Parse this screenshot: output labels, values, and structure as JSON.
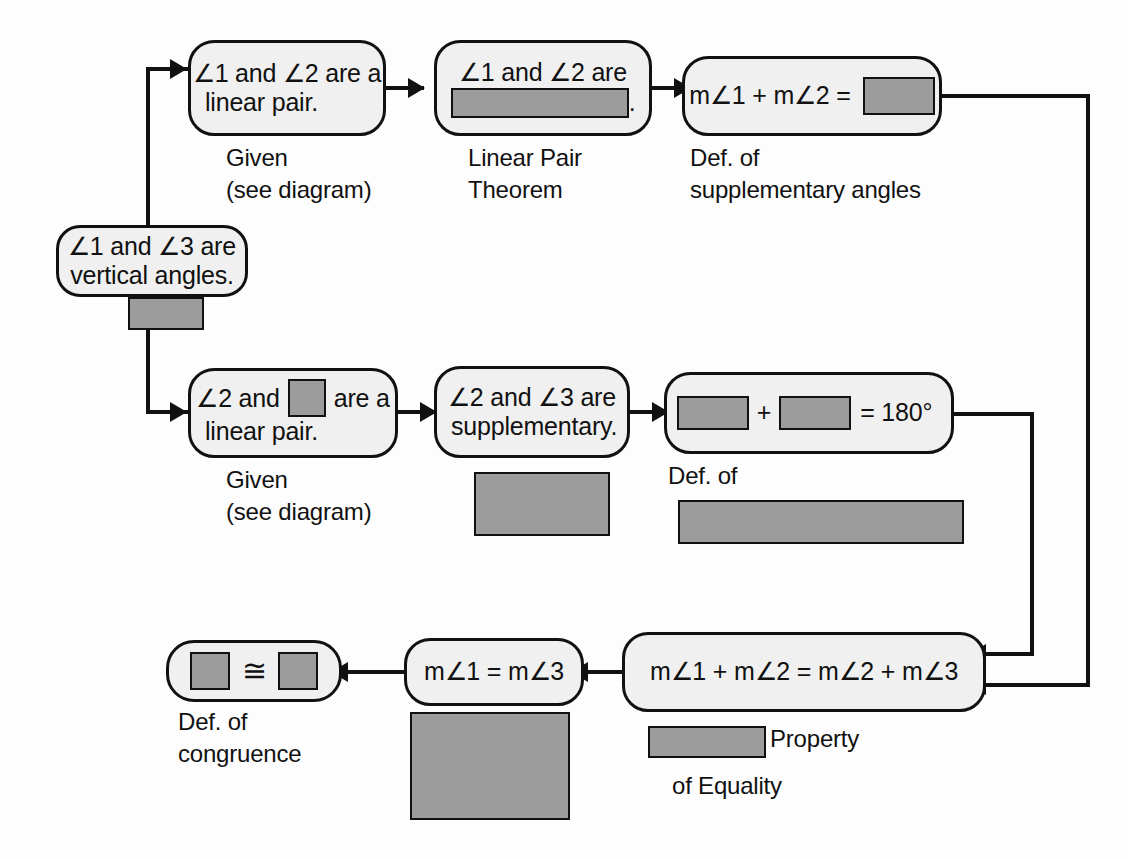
{
  "diagram": {
    "type": "flowchart-proof",
    "title_visible": false,
    "colors": {
      "redaction_gray": "#9c9c9c",
      "node_fill": "#f0f0f0",
      "stroke": "#111111",
      "background": "#ffffff"
    }
  },
  "nodes": {
    "vertical_angles": {
      "line1": "∠1 and ∠3 are",
      "line2": "vertical angles."
    },
    "linear_pair_12": {
      "line1": "∠1 and ∠2 are a",
      "line2": "linear pair."
    },
    "lp_theorem_result": {
      "prefix": "∠1 and ∠2 are",
      "redacted": "",
      "suffix": "."
    },
    "def_supp_result": {
      "prefix": "m∠1 + m∠2 =",
      "redacted": ""
    },
    "linear_pair_23": {
      "prefix": "∠2 and",
      "redacted": "",
      "mid": "are a",
      "line2": "linear pair."
    },
    "supplementary_23": {
      "line1": "∠2 and ∠3 are",
      "line2": "supplementary."
    },
    "sum_180": {
      "redacted_a": "",
      "plus": "+",
      "redacted_b": "",
      "equals": "= 180°"
    },
    "transitive_eq": {
      "text": "m∠1 + m∠2 = m∠2 + m∠3"
    },
    "m1_eq_m3": {
      "text": "m∠1 = m∠3"
    },
    "congruence_result": {
      "redacted_a": "",
      "symbol": "≅",
      "redacted_b": ""
    }
  },
  "captions": {
    "given_top": {
      "line1": "Given",
      "line2": "(see diagram)"
    },
    "linear_pair_theorem": {
      "line1": "Linear Pair",
      "line2": "Theorem"
    },
    "def_supplementary": {
      "line1": "Def. of",
      "line2": "supplementary angles"
    },
    "given_middle": {
      "line1": "Given",
      "line2": "(see diagram)"
    },
    "redacted_reason_supp": {
      "redacted": ""
    },
    "def_of_redacted": {
      "line1": "Def. of",
      "redacted": ""
    },
    "vertical_angles_reason": {
      "redacted": ""
    },
    "property_of_equality": {
      "redacted": "",
      "line1": "Property",
      "line2": "of Equality"
    },
    "def_congruence": {
      "line1": "Def. of",
      "line2": "congruence"
    },
    "redacted_reason_m1m3": {
      "redacted": ""
    }
  }
}
